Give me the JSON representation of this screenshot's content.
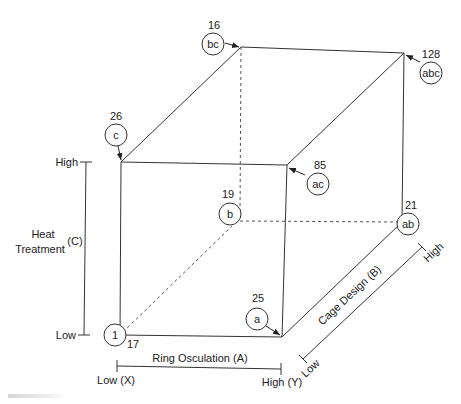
{
  "figure": {
    "type": "cube-factorial-design",
    "caption_fragment": "FIGURE ..."
  },
  "axes": {
    "A": {
      "label": "Ring Osculation (A)",
      "low": "Low (X)",
      "high": "High (Y)"
    },
    "B": {
      "label": "Cage Design (B)",
      "low": "Low",
      "high": "High"
    },
    "C": {
      "label_line1": "Heat",
      "label_line2": "Treatment",
      "code": "(C)",
      "low": "Low",
      "high": "High"
    }
  },
  "corners": [
    {
      "id": "1",
      "label": "1",
      "value": "17"
    },
    {
      "id": "a",
      "label": "a",
      "value": "25"
    },
    {
      "id": "b",
      "label": "b",
      "value": "19"
    },
    {
      "id": "ab",
      "label": "ab",
      "value": "21"
    },
    {
      "id": "c",
      "label": "c",
      "value": "26"
    },
    {
      "id": "ac",
      "label": "ac",
      "value": "85"
    },
    {
      "id": "bc",
      "label": "bc",
      "value": "16"
    },
    {
      "id": "abc",
      "label": "abc",
      "value": "128"
    }
  ],
  "colors": {
    "line": "#333333",
    "text": "#222222",
    "background": "#ffffff"
  }
}
